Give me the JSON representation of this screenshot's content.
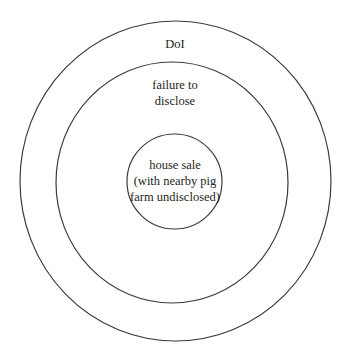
{
  "diagram": {
    "type": "nested-circles",
    "stroke_color": "#3a3a3a",
    "background": "#ffffff",
    "circles": [
      {
        "id": "outer",
        "lines": [
          "DoI"
        ]
      },
      {
        "id": "middle",
        "lines": [
          "failure to",
          "disclose"
        ]
      },
      {
        "id": "inner",
        "lines": [
          "house sale",
          "(with nearby pig",
          "farm undisclosed)"
        ]
      }
    ]
  }
}
